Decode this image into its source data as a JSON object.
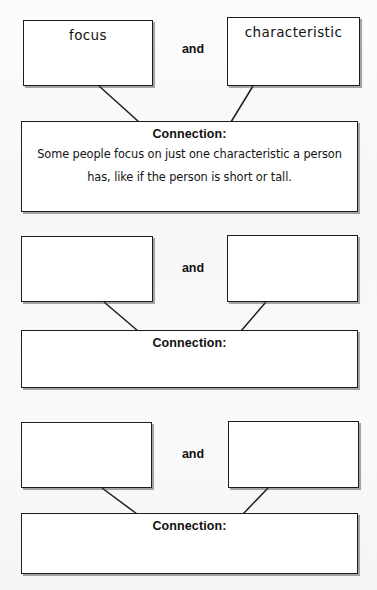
{
  "document": {
    "type": "vocabulary-connection-worksheet",
    "background_color": "#fbfbfb",
    "ink_color": "#1d1d1d"
  },
  "groups": [
    {
      "id": "group-1",
      "term_left": "focus",
      "term_right": "characteristic",
      "conjunction": "and",
      "connection_label": "Connection:",
      "connection_text": "Some people focus on just one characteristic a person has, like if the person is short or tall.",
      "filled": true
    },
    {
      "id": "group-2",
      "term_left": "",
      "term_right": "",
      "conjunction": "and",
      "connection_label": "Connection:",
      "connection_text": "",
      "filled": false
    },
    {
      "id": "group-3",
      "term_left": "",
      "term_right": "",
      "conjunction": "and",
      "connection_label": "Connection:",
      "connection_text": "",
      "filled": false
    }
  ]
}
